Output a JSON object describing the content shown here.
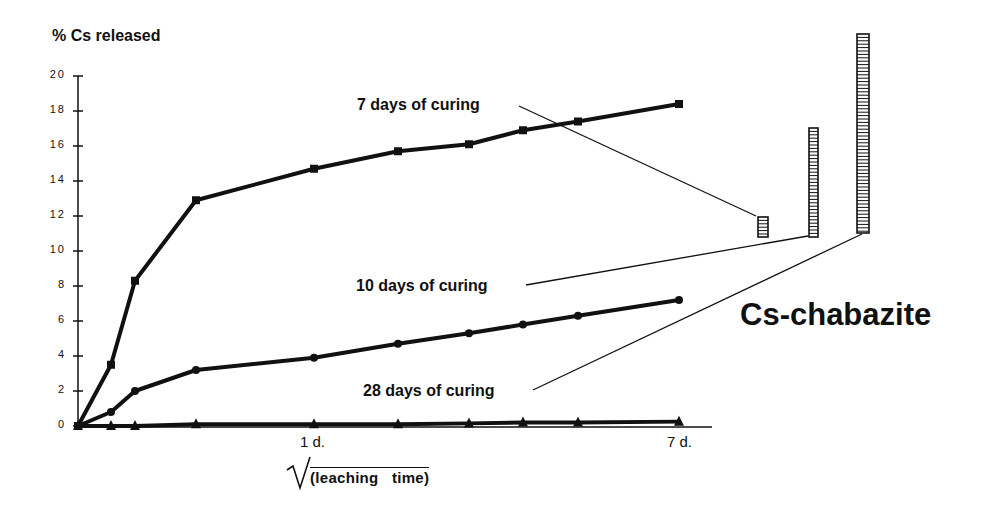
{
  "chart_data": {
    "type": "line",
    "title": "",
    "ylabel": "% Cs released",
    "xlabel": "√(leaching time)",
    "ylim": [
      0,
      20
    ],
    "yticks": [
      0,
      2,
      4,
      6,
      8,
      10,
      12,
      14,
      16,
      18,
      20
    ],
    "xtick_labels": [
      {
        "label": "1 d.",
        "x_index": 4
      },
      {
        "label": "7 d.",
        "x_index": 9
      }
    ],
    "grid": false,
    "x_px": [
      78,
      111,
      135,
      196,
      314,
      398,
      469,
      523,
      578,
      679
    ],
    "series": [
      {
        "name": "7 days of curing",
        "marker": "square",
        "values": [
          0,
          3.5,
          8.3,
          12.9,
          14.7,
          15.7,
          16.1,
          16.9,
          17.4,
          18.4
        ]
      },
      {
        "name": "10 days of curing",
        "marker": "circle",
        "values": [
          0,
          0.8,
          2.0,
          3.2,
          3.9,
          4.7,
          5.3,
          5.8,
          6.3,
          7.2
        ]
      },
      {
        "name": "28 days of curing",
        "marker": "triangle",
        "values": [
          0,
          0,
          0,
          0.1,
          0.1,
          0.1,
          0.15,
          0.2,
          0.2,
          0.25
        ]
      }
    ],
    "annotations": [
      {
        "text": "7 days of curing",
        "points_to": "short bar"
      },
      {
        "text": "10 days of curing",
        "points_to": "medium bar"
      },
      {
        "text": "28 days of curing",
        "points_to": "tall bar"
      },
      {
        "text": "Cs-chabazite"
      }
    ],
    "inset_bars": [
      {
        "label": "7 days of curing",
        "relative_height": "short"
      },
      {
        "label": "10 days of curing",
        "relative_height": "medium"
      },
      {
        "label": "28 days of curing",
        "relative_height": "tall"
      }
    ]
  },
  "labels": {
    "ylabel": "% Cs released",
    "series1": "7 days of curing",
    "series2": "10 days of curing",
    "series3": "28 days of curing",
    "material": "Cs-chabazite",
    "xtick_1d": "1 d.",
    "xtick_7d": "7 d.",
    "xlabel": "(leaching   time)"
  },
  "yticks": [
    "20",
    "18",
    "16",
    "14",
    "12",
    "10",
    "8",
    "6",
    "4",
    "2",
    "0"
  ]
}
